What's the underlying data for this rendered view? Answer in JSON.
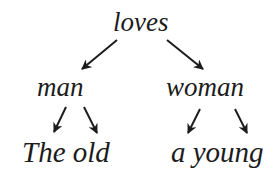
{
  "diagram": {
    "type": "dependency-tree",
    "root": {
      "label": "loves"
    },
    "level1": [
      {
        "label": "man"
      },
      {
        "label": "woman"
      }
    ],
    "level2": [
      {
        "label": "The old",
        "parent": "man"
      },
      {
        "label": "a young",
        "parent": "woman"
      }
    ],
    "edges": [
      {
        "from": "loves",
        "to": "man"
      },
      {
        "from": "loves",
        "to": "woman"
      },
      {
        "from": "man",
        "to": "The"
      },
      {
        "from": "man",
        "to": "old"
      },
      {
        "from": "woman",
        "to": "a"
      },
      {
        "from": "woman",
        "to": "young"
      }
    ],
    "colors": {
      "text": "#1c1c1c",
      "arrow": "#1c1c1c",
      "background": "#ffffff"
    }
  }
}
